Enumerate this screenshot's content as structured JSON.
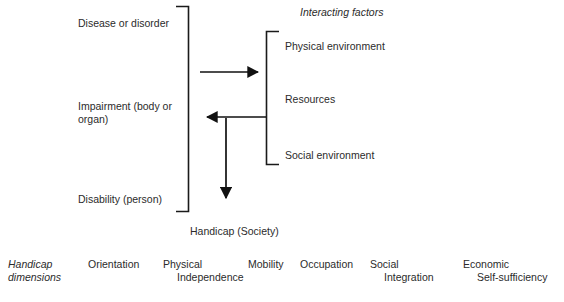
{
  "diagram": {
    "title_implicit": "",
    "impairment_chain": {
      "items": [
        {
          "id": "disease",
          "label": "Disease or disorder"
        },
        {
          "id": "impairment",
          "label": "Impairment (body or\norgan)"
        },
        {
          "id": "disability",
          "label": "Disability (person)"
        }
      ],
      "bracket": {
        "orientation": "right-facing",
        "x": 188,
        "top": 6,
        "bottom": 212
      }
    },
    "outcome": {
      "label": "Handicap (Society)"
    },
    "interacting_factors": {
      "heading": "Interacting factors",
      "items": [
        {
          "id": "physical-environment",
          "label": "Physical environment"
        },
        {
          "id": "resources",
          "label": "Resources"
        },
        {
          "id": "social-environment",
          "label": "Social environment"
        }
      ],
      "bracket": {
        "orientation": "left-facing",
        "x": 266,
        "top": 31,
        "bottom": 165
      }
    },
    "arrows": [
      {
        "id": "impairment-to-factors",
        "direction": "right",
        "from_x": 200,
        "to_x": 264,
        "y": 72
      },
      {
        "id": "factors-to-impairment",
        "direction": "left",
        "from_x": 266,
        "to_x": 201,
        "y": 117
      },
      {
        "id": "to-handicap",
        "direction": "down",
        "x": 226,
        "from_y": 118,
        "to_y": 206
      }
    ],
    "colors": {
      "ink": "#1a1a1a",
      "text": "#2b2b2b",
      "background": "#ffffff"
    }
  },
  "dimensions_row": {
    "title_line1": "Handicap",
    "title_line2": "dimensions",
    "items": [
      {
        "id": "orientation",
        "line1": "Orientation",
        "line2": ""
      },
      {
        "id": "physical-independence",
        "line1": "Physical",
        "line2": "Independence"
      },
      {
        "id": "mobility",
        "line1": "Mobility",
        "line2": ""
      },
      {
        "id": "occupation",
        "line1": "Occupation",
        "line2": ""
      },
      {
        "id": "social-integration",
        "line1": "Social",
        "line2": "Integration"
      },
      {
        "id": "economic-self-sufficiency",
        "line1": "Economic",
        "line2": "Self-sufficiency"
      }
    ]
  }
}
